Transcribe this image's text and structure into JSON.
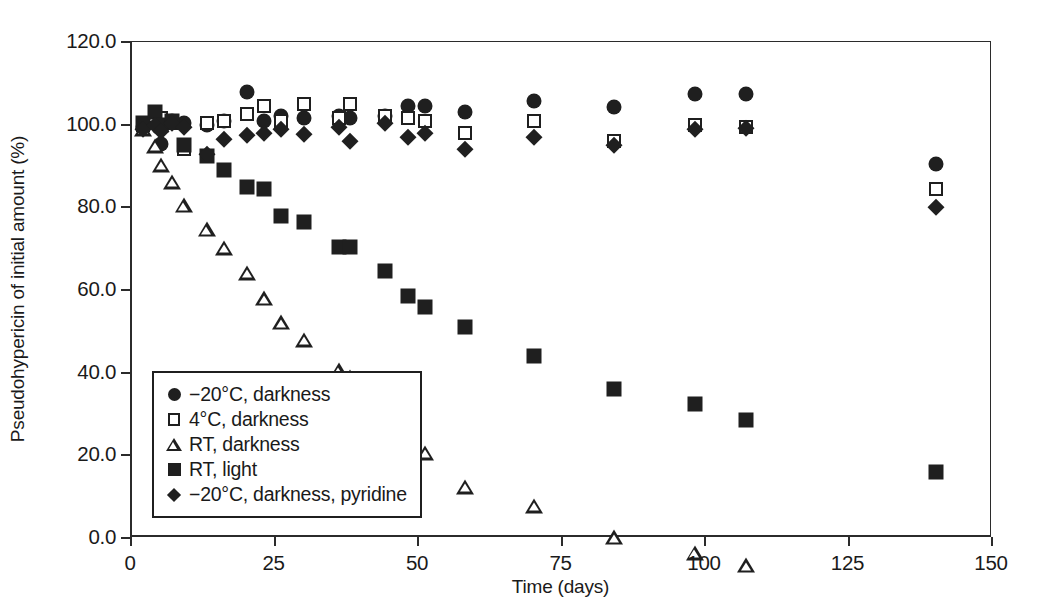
{
  "chart_data": {
    "type": "scatter",
    "title": "",
    "xlabel": "Time (days)",
    "ylabel": "Pseudohypericin of initial amount (%)",
    "xlim": [
      0,
      150
    ],
    "ylim": [
      0,
      120
    ],
    "xticks": [
      "0",
      "25",
      "50",
      "75",
      "100",
      "125",
      "150"
    ],
    "xtick_values": [
      0,
      25,
      50,
      75,
      100,
      125,
      150
    ],
    "yticks": [
      "0.0",
      "20.0",
      "40.0",
      "60.0",
      "80.0",
      "100.0",
      "120.0"
    ],
    "ytick_values": [
      0,
      20,
      40,
      60,
      80,
      100,
      120
    ],
    "grid": false,
    "legend_position": "lower-left-inside",
    "marker_color": "#1f1f1f",
    "series": [
      {
        "name": "−20°C, darkness",
        "marker": "circle-filled",
        "x": [
          2,
          4,
          5,
          7,
          9,
          13,
          16,
          20,
          23,
          26,
          30,
          36,
          38,
          44,
          48,
          51,
          58,
          70,
          84,
          98,
          107,
          140
        ],
        "y": [
          99.5,
          100.5,
          95.3,
          101.0,
          100.3,
          100.0,
          101.0,
          108.0,
          101.0,
          102.0,
          101.5,
          102.0,
          101.5,
          102.0,
          104.5,
          104.5,
          103.0,
          105.8,
          104.2,
          107.5,
          107.5,
          90.5
        ]
      },
      {
        "name": "4°C, darkness",
        "marker": "square-open",
        "x": [
          2,
          4,
          5,
          7,
          9,
          13,
          16,
          20,
          23,
          26,
          30,
          36,
          38,
          44,
          48,
          51,
          58,
          70,
          84,
          98,
          107,
          140
        ],
        "y": [
          100.0,
          102.0,
          101.5,
          100.5,
          94.0,
          100.5,
          101.0,
          102.5,
          104.5,
          101.0,
          105.0,
          101.5,
          105.0,
          102.0,
          101.5,
          101.0,
          98.0,
          101.0,
          96.0,
          99.8,
          99.5,
          84.5
        ]
      },
      {
        "name": "RT, darkness",
        "marker": "triangle-open",
        "x": [
          2,
          4,
          5,
          7,
          9,
          13,
          16,
          20,
          23,
          26,
          30,
          36,
          38,
          44,
          48,
          51,
          58,
          70,
          84,
          98,
          107,
          140
        ],
        "y": [
          99.0,
          98.5,
          97.5,
          97.0,
          95.0,
          92.8,
          92.0,
          89.5,
          87.0,
          84.8,
          84.3,
          80.5,
          82.5,
          77.5,
          76.0,
          75.0,
          70.5,
          69.5,
          65.5,
          65.3,
          66.0,
          54.0
        ]
      },
      {
        "name": "RT, light",
        "marker": "square-filled",
        "x": [
          2,
          4,
          5,
          7,
          9,
          13,
          16,
          20,
          23,
          26,
          30,
          36,
          38,
          44,
          48,
          51,
          58,
          70,
          84,
          98,
          107,
          140
        ],
        "y": [
          100.5,
          103.0,
          100.0,
          101.0,
          95.0,
          92.5,
          89.0,
          85.0,
          84.5,
          77.8,
          76.5,
          70.3,
          70.3,
          64.5,
          58.5,
          56.0,
          51.0,
          44.0,
          36.0,
          32.5,
          28.5,
          16.0
        ]
      },
      {
        "name": "−20°C, darkness, pyridine",
        "marker": "diamond-filled",
        "x": [
          2,
          4,
          5,
          7,
          9,
          13,
          16,
          20,
          23,
          26,
          30,
          36,
          38,
          44,
          48,
          51,
          58,
          70,
          84,
          98,
          107,
          140
        ],
        "y": [
          99.0,
          100.0,
          98.5,
          100.5,
          99.5,
          93.0,
          96.5,
          97.5,
          98.0,
          99.0,
          97.8,
          99.5,
          96.0,
          100.5,
          97.0,
          98.0,
          94.0,
          97.0,
          95.0,
          99.0,
          99.3,
          80.0
        ]
      }
    ]
  },
  "legend": {
    "items": [
      {
        "marker": "circle-filled",
        "label": "−20°C, darkness"
      },
      {
        "marker": "square-open",
        "label": "4°C, darkness"
      },
      {
        "marker": "triangle-open",
        "label": "RT, darkness"
      },
      {
        "marker": "square-filled",
        "label": "RT, light"
      },
      {
        "marker": "diamond-filled",
        "label": "−20°C, darkness, pyridine"
      }
    ]
  }
}
